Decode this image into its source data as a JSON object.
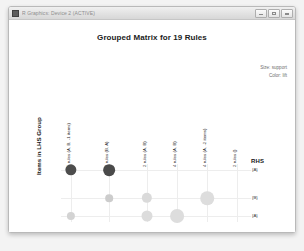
{
  "window": {
    "title": "R Graphics: Device 2 (ACTIVE)",
    "icon": "r-graphics-icon",
    "buttons": {
      "minimize": "Minimize",
      "maximize": "Maximize",
      "close": "Close"
    }
  },
  "legend": {
    "size_line": "Size: support",
    "color_line": "Color: lift"
  },
  "axes": {
    "ylabel": "Items in LHS Group",
    "rhs_header": "RHS"
  },
  "chart_data": {
    "type": "scatter",
    "title": "Grouped Matrix for 19 Rules",
    "xlabel": "",
    "ylabel": "Items in LHS Group",
    "grid": true,
    "legend_position": "top-right",
    "size_encoding": "support",
    "color_encoding": "lift",
    "categories": [
      "5 rules (A, B, -1 items)",
      "2 rules (B, A)",
      "2 rules (A, B)",
      "4 rules (A, B)",
      "4 rules (A, -2 items)",
      "4 rules (A, -2 items)",
      "2 rules ()"
    ],
    "columns": [
      "5 rules (A, B, -1 items)",
      "2 rules (B, A)",
      "2 rules (A, B)",
      "4 rules (A, B)",
      "4 rules (A, -2 items)",
      "2 rules ()"
    ],
    "rows": [
      "{A}",
      "{B}",
      "{A}"
    ],
    "points": [
      {
        "col": 0,
        "row": 0,
        "support": 0.52,
        "lift": 0.93
      },
      {
        "col": 0,
        "row": 2,
        "support": 0.3,
        "lift": 0.14
      },
      {
        "col": 1,
        "row": 0,
        "support": 0.55,
        "lift": 0.95
      },
      {
        "col": 1,
        "row": 1,
        "support": 0.26,
        "lift": 0.18
      },
      {
        "col": 2,
        "row": 1,
        "support": 0.45,
        "lift": 0.1
      },
      {
        "col": 2,
        "row": 2,
        "support": 0.5,
        "lift": 0.09
      },
      {
        "col": 3,
        "row": 2,
        "support": 0.7,
        "lift": 0.08
      },
      {
        "col": 4,
        "row": 1,
        "support": 0.68,
        "lift": 0.08
      }
    ]
  }
}
